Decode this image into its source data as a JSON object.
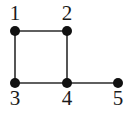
{
  "figure": {
    "name": "undirected-graph-diagram",
    "background_color": "#ffffff",
    "width": 128,
    "height": 116
  },
  "style": {
    "node_color": "#111111",
    "node_radius": 5,
    "edge_color": "#2b2b2b",
    "edge_width": 1.6,
    "label_color": "#1a1a1a",
    "label_font_size": 21
  },
  "chart_data": {
    "type": "diagram",
    "subtype": "undirected-graph",
    "title": "",
    "node_count": 5,
    "edge_count": 5,
    "nodes": [
      {
        "id": "1",
        "label": "1",
        "x": 15,
        "y": 31,
        "label_x": 5,
        "label_y": 3,
        "label_position": "above"
      },
      {
        "id": "2",
        "label": "2",
        "x": 67,
        "y": 31,
        "label_x": 57,
        "label_y": 3,
        "label_position": "above"
      },
      {
        "id": "3",
        "label": "3",
        "x": 15,
        "y": 83,
        "label_x": 5,
        "label_y": 88,
        "label_position": "below"
      },
      {
        "id": "4",
        "label": "4",
        "x": 67,
        "y": 83,
        "label_x": 57,
        "label_y": 88,
        "label_position": "below"
      },
      {
        "id": "5",
        "label": "5",
        "x": 118,
        "y": 83,
        "label_x": 108,
        "label_y": 88,
        "label_position": "below"
      }
    ],
    "edges": [
      {
        "source": "1",
        "target": "2",
        "x1": 15,
        "y1": 31,
        "x2": 67,
        "y2": 31
      },
      {
        "source": "1",
        "target": "3",
        "x1": 15,
        "y1": 31,
        "x2": 15,
        "y2": 83
      },
      {
        "source": "2",
        "target": "4",
        "x1": 67,
        "y1": 31,
        "x2": 67,
        "y2": 83
      },
      {
        "source": "3",
        "target": "4",
        "x1": 15,
        "y1": 83,
        "x2": 67,
        "y2": 83
      },
      {
        "source": "4",
        "target": "5",
        "x1": 67,
        "y1": 83,
        "x2": 118,
        "y2": 83
      }
    ]
  }
}
